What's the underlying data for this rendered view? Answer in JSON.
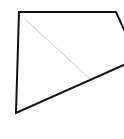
{
  "diagram": {
    "background": "#ffffff",
    "polygon": {
      "points": [
        [
          19,
          12
        ],
        [
          116,
          12
        ],
        [
          126,
          34
        ],
        [
          126,
          64
        ],
        [
          16,
          113
        ]
      ],
      "stroke": "#111111",
      "stroke_width": 2
    },
    "diagonal": {
      "from": [
        25,
        19
      ],
      "to": [
        90,
        79
      ],
      "stroke": "#cccccc",
      "stroke_width": 1
    }
  }
}
